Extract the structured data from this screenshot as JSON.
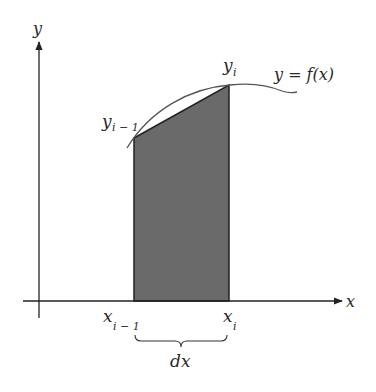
{
  "diagram": {
    "axes": {
      "x_label": "x",
      "y_label": "y"
    },
    "curve_label": "y = f(x)",
    "points": {
      "left_y": {
        "base": "y",
        "sub": "i − 1"
      },
      "right_y": {
        "base": "y",
        "sub": "i"
      },
      "left_x": {
        "base": "x",
        "sub": "i − 1"
      },
      "right_x": {
        "base": "x",
        "sub": "i"
      }
    },
    "width_label": "dx",
    "colors": {
      "fill": "#6a6a6a",
      "stroke": "#222222",
      "curve": "#555555"
    }
  }
}
